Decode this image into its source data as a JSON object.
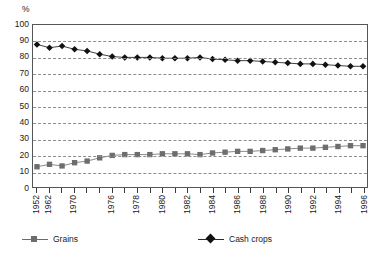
{
  "figure": {
    "unit_label": "%",
    "y_axis": {
      "ticks": [
        0,
        10,
        20,
        30,
        40,
        50,
        60,
        70,
        80,
        90,
        100
      ],
      "min": 0,
      "max": 100
    },
    "x_axis": {
      "labels": [
        "1952",
        "1962",
        "1970",
        "1976",
        "1978",
        "1980",
        "1982",
        "1984",
        "1986",
        "1988",
        "1990",
        "1992",
        "1994",
        "1996"
      ]
    },
    "legend": {
      "grains_label": "Grains",
      "cash_label": "Cash crops",
      "grains_color": "#6d6d6d",
      "cash_color": "#111111"
    }
  },
  "chart_data": {
    "type": "line",
    "title": "",
    "subtitle": "",
    "xlabel": "",
    "ylabel": "%",
    "ylim": [
      0,
      100
    ],
    "yticks": [
      0,
      10,
      20,
      30,
      40,
      50,
      60,
      70,
      80,
      90,
      100
    ],
    "grid": "horizontal-dashed",
    "legend_position": "bottom",
    "x": [
      "1952",
      "1962",
      "1968",
      "1970",
      "1972",
      "1974",
      "1976",
      "1977",
      "1978",
      "1979",
      "1980",
      "1981",
      "1982",
      "1983",
      "1984",
      "1985",
      "1986",
      "1987",
      "1988",
      "1989",
      "1990",
      "1991",
      "1992",
      "1993",
      "1994",
      "1995",
      "1996"
    ],
    "xtick_labels": [
      "1952",
      "1962",
      "",
      "1970",
      "",
      "",
      "1976",
      "",
      "1978",
      "",
      "1980",
      "",
      "1982",
      "",
      "1984",
      "",
      "1986",
      "",
      "1988",
      "",
      "1990",
      "",
      "1992",
      "",
      "1994",
      "",
      "1996"
    ],
    "series": [
      {
        "name": "Cash crops",
        "color": "#111111",
        "marker": "diamond",
        "values": [
          88,
          86,
          87,
          85,
          84,
          82,
          80.5,
          80,
          80,
          80,
          79.5,
          79.5,
          79.5,
          80,
          79,
          78.5,
          78,
          78,
          77.5,
          77,
          76.5,
          76,
          76,
          75.5,
          75,
          74.5,
          74.5
        ]
      },
      {
        "name": "Grains",
        "color": "#6d6d6d",
        "marker": "square",
        "values": [
          12.5,
          14,
          13,
          15,
          16,
          18,
          19.5,
          20,
          20,
          20,
          20.5,
          20.5,
          20.5,
          20,
          21,
          21.5,
          22,
          22,
          22.5,
          23,
          23.5,
          24,
          24,
          24.5,
          25,
          25.5,
          25.5
        ]
      }
    ]
  }
}
